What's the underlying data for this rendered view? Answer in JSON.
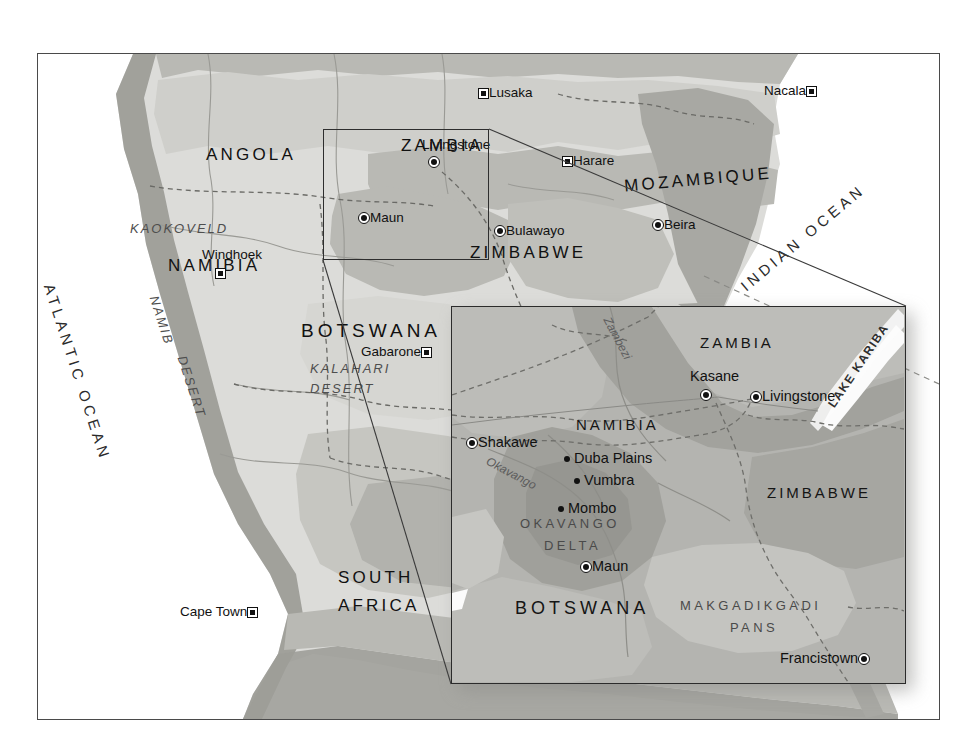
{
  "map": {
    "title": "Southern Africa regional map with Okavango Delta inset",
    "colors": {
      "land_light": "#dcdcd9",
      "land_mid": "#cfcfcb",
      "land_dark": "#b9b9b4",
      "land_darkest": "#a8a8a3",
      "ocean": "#ffffff",
      "inset_base": "#b4b4b0",
      "frame": "#4a4a4a",
      "text": "#1a1a1a"
    },
    "main": {
      "countries": [
        {
          "name": "ANGOLA",
          "x": 168,
          "y": 92
        },
        {
          "name": "ZAMBIA",
          "x": 363,
          "y": 83
        },
        {
          "name": "MOZAMBIQUE",
          "x": 625,
          "y": 117
        },
        {
          "name": "NAMIBIA",
          "x": 140,
          "y": 203
        },
        {
          "name": "ZIMBABWE",
          "x": 465,
          "y": 194
        },
        {
          "name": "BOTSWANA",
          "x": 297,
          "y": 267
        },
        {
          "name": "SOUTH",
          "x": 310,
          "y": 518
        },
        {
          "name": "AFRICA",
          "x": 310,
          "y": 546
        }
      ],
      "regions": [
        {
          "name": "KAOKOVELD",
          "x": 100,
          "y": 170
        },
        {
          "name": "KALAHARI",
          "x": 310,
          "y": 310
        },
        {
          "name": "DESERT",
          "x": 310,
          "y": 330
        },
        {
          "name": "NAMIB",
          "x": 165,
          "y": 285
        },
        {
          "name": "DESERT",
          "x": 188,
          "y": 380
        }
      ],
      "oceans": [
        {
          "name": "ATLANTIC OCEAN",
          "x": 55,
          "y": 300
        },
        {
          "name": "INDIAN OCEAN",
          "x": 760,
          "y": 190
        }
      ],
      "cities": [
        {
          "name": "Lusaka",
          "x": 476,
          "y": 88,
          "marker": "capital",
          "label_side": "right"
        },
        {
          "name": "Nacala",
          "x": 770,
          "y": 88,
          "marker": "capital",
          "label_side": "left"
        },
        {
          "name": "Livingstone",
          "x": 425,
          "y": 142,
          "marker": "city",
          "label_side": "above"
        },
        {
          "name": "Harare",
          "x": 563,
          "y": 158,
          "marker": "capital",
          "label_side": "right"
        },
        {
          "name": "Maun",
          "x": 360,
          "y": 212,
          "marker": "city",
          "label_side": "right"
        },
        {
          "name": "Bulawayo",
          "x": 497,
          "y": 226,
          "marker": "city",
          "label_side": "right"
        },
        {
          "name": "Beira",
          "x": 655,
          "y": 221,
          "marker": "city",
          "label_side": "right"
        },
        {
          "name": "Windhoek",
          "x": 205,
          "y": 254,
          "marker": "capital",
          "label_side": "above"
        },
        {
          "name": "Gabarone",
          "x": 432,
          "y": 350,
          "marker": "capital",
          "label_side": "left"
        },
        {
          "name": "Cape Town",
          "x": 261,
          "y": 610,
          "marker": "capital",
          "label_side": "left"
        }
      ]
    },
    "inset": {
      "countries": [
        {
          "name": "ZAMBIA",
          "x": 266,
          "y": 60
        },
        {
          "name": "NAMIBIA",
          "x": 113,
          "y": 137
        },
        {
          "name": "ZIMBABWE",
          "x": 335,
          "y": 205
        },
        {
          "name": "BOTSWANA",
          "x": 63,
          "y": 313
        }
      ],
      "regions": [
        {
          "name": "OKAVANGO",
          "x": 78,
          "y": 228
        },
        {
          "name": "DELTA",
          "x": 98,
          "y": 248
        },
        {
          "name": "MAKGADIKGADI",
          "x": 245,
          "y": 310
        },
        {
          "name": "PANS",
          "x": 293,
          "y": 330
        }
      ],
      "waters": [
        {
          "name": "Zambezi",
          "x": 178,
          "y": 18,
          "rotate": -62
        },
        {
          "name": "Okavango",
          "x": 48,
          "y": 172,
          "rotate": 30
        },
        {
          "name": "LAKE KARIBA",
          "x": 400,
          "y": 50,
          "rotate": -58
        }
      ],
      "cities": [
        {
          "name": "Kasane",
          "x": 254,
          "y": 88,
          "marker": "city",
          "label_side": "above"
        },
        {
          "name": "Livingstone",
          "x": 303,
          "y": 96,
          "marker": "city",
          "label_side": "right"
        },
        {
          "name": "Shakawe",
          "x": 22,
          "y": 139,
          "marker": "city",
          "label_side": "right"
        },
        {
          "name": "Duba Plains",
          "x": 117,
          "y": 155,
          "marker": "plain",
          "label_side": "right"
        },
        {
          "name": "Vumbra",
          "x": 126,
          "y": 176,
          "marker": "plain",
          "label_side": "right"
        },
        {
          "name": "Mombo",
          "x": 110,
          "y": 205,
          "marker": "plain",
          "label_side": "right"
        },
        {
          "name": "Maun",
          "x": 133,
          "y": 263,
          "marker": "city",
          "label_side": "right"
        },
        {
          "name": "Francistown",
          "x": 411,
          "y": 355,
          "marker": "city",
          "label_side": "left"
        }
      ]
    }
  }
}
